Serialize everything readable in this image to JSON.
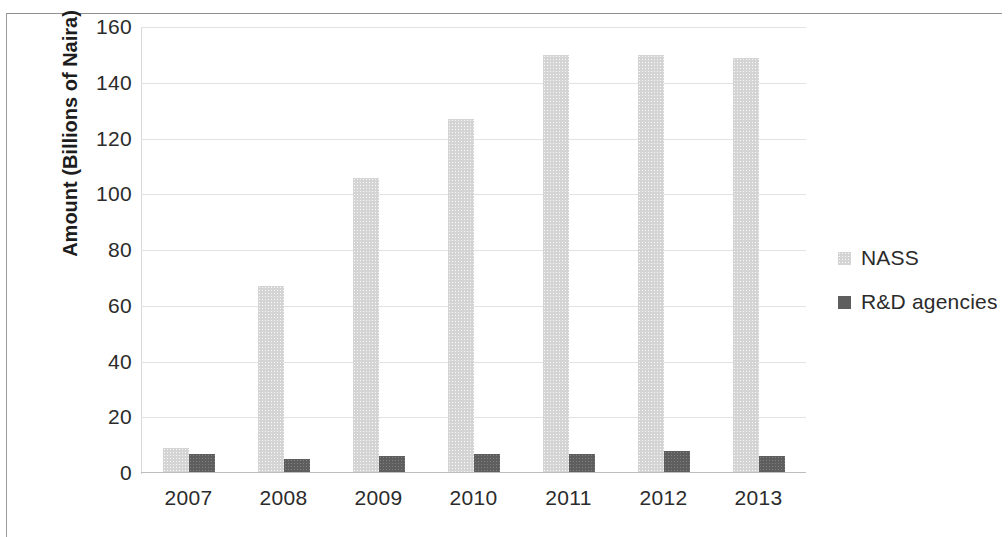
{
  "chart_data": {
    "type": "bar",
    "title": "",
    "subtitle": "",
    "xlabel": "",
    "ylabel": "Amount (Billions of Naira)",
    "categories": [
      "2007",
      "2008",
      "2009",
      "2010",
      "2011",
      "2012",
      "2013"
    ],
    "series": [
      {
        "name": "NASS",
        "color": "#d4d4d4",
        "values": [
          9,
          67,
          106,
          127,
          150,
          150,
          149
        ]
      },
      {
        "name": "R&D agencies",
        "color": "#5e5e5e",
        "values": [
          7,
          5,
          6,
          7,
          7,
          8,
          6
        ]
      }
    ],
    "ylim": [
      0,
      160
    ],
    "ytick_labels": [
      "160",
      "140",
      "120",
      "100",
      "80",
      "60",
      "40",
      "20",
      "0"
    ],
    "ytick_values": [
      160,
      140,
      120,
      100,
      80,
      60,
      40,
      20,
      0
    ],
    "grid": true,
    "grid_axis": "y",
    "legend_position": "right",
    "legend_entries": [
      "NASS",
      "R&D agencies"
    ]
  }
}
